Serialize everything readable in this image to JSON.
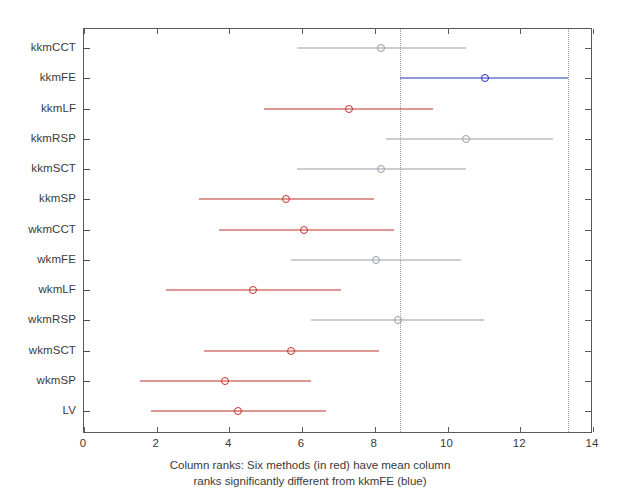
{
  "chart_data": {
    "type": "scatter",
    "title": "",
    "subtitle": "",
    "xlabel_line1": "Column ranks: Six methods (in red) have mean column",
    "xlabel_line2": "ranks significantly different from kkmFE (blue)",
    "ylabel": "",
    "xlim": [
      0,
      14
    ],
    "xticks": [
      0,
      2,
      4,
      6,
      8,
      10,
      12,
      14
    ],
    "xticklabels": [
      "0",
      "2",
      "4",
      "6",
      "8",
      "10",
      "12",
      "14"
    ],
    "grid": false,
    "legend": "none",
    "orientation": "horizontal",
    "reference_lines": {
      "label": "kkmFE comparison interval bounds",
      "values": [
        8.7,
        13.3
      ],
      "style": "dotted",
      "color": "#9a9aa8"
    },
    "color_legend": {
      "selected": "#2030c0",
      "significant": "#c03028",
      "not_significant": "#9a9aa8"
    },
    "categories": [
      "kkmCCT",
      "kkmFE",
      "kkmLF",
      "kkmRSP",
      "kkmSCT",
      "kkmSP",
      "wkmCCT",
      "wkmFE",
      "wkmLF",
      "wkmRSP",
      "wkmSCT",
      "wkmSP",
      "LV"
    ],
    "series": [
      {
        "name": "Mean column rank with comparison interval",
        "points": [
          {
            "category": "kkmCCT",
            "mean": 8.16,
            "lower": 5.85,
            "upper": 10.5,
            "group": "not_significant"
          },
          {
            "category": "kkmFE",
            "mean": 11.04,
            "lower": 8.7,
            "upper": 13.3,
            "group": "selected"
          },
          {
            "category": "kkmLF",
            "mean": 7.28,
            "lower": 4.95,
            "upper": 9.6,
            "group": "significant"
          },
          {
            "category": "kkmRSP",
            "mean": 10.52,
            "lower": 8.3,
            "upper": 12.9,
            "group": "not_significant"
          },
          {
            "category": "kkmSCT",
            "mean": 8.16,
            "lower": 5.85,
            "upper": 10.5,
            "group": "not_significant"
          },
          {
            "category": "kkmSP",
            "mean": 5.55,
            "lower": 3.16,
            "upper": 7.97,
            "group": "significant"
          },
          {
            "category": "wkmCCT",
            "mean": 6.04,
            "lower": 3.71,
            "upper": 8.52,
            "group": "significant"
          },
          {
            "category": "wkmFE",
            "mean": 8.02,
            "lower": 5.69,
            "upper": 10.36,
            "group": "not_significant"
          },
          {
            "category": "wkmLF",
            "mean": 4.64,
            "lower": 2.25,
            "upper": 7.06,
            "group": "significant"
          },
          {
            "category": "wkmRSP",
            "mean": 8.63,
            "lower": 6.24,
            "upper": 10.99,
            "group": "not_significant"
          },
          {
            "category": "wkmSCT",
            "mean": 5.69,
            "lower": 3.3,
            "upper": 8.11,
            "group": "significant"
          },
          {
            "category": "wkmSP",
            "mean": 3.88,
            "lower": 1.54,
            "upper": 6.24,
            "group": "significant"
          },
          {
            "category": "LV",
            "mean": 4.23,
            "lower": 1.84,
            "upper": 6.65,
            "group": "significant"
          }
        ]
      }
    ]
  }
}
